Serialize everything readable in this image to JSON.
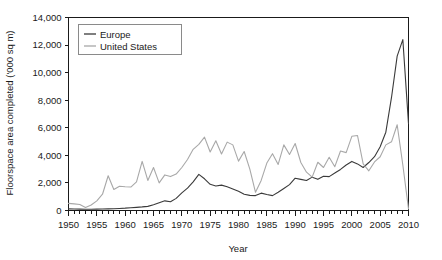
{
  "chart_data": {
    "type": "line",
    "title": "",
    "xlabel": "Year",
    "ylabel": "Floorspace area completed ('000 sq m)",
    "xlim": [
      1950,
      2010
    ],
    "ylim": [
      0,
      14000
    ],
    "ytick_step": 2000,
    "xtick_major_step": 5,
    "xtick_minor_step": 1,
    "grid": false,
    "legend_position": "top-left",
    "ytick_labels": [
      "0",
      "2,000",
      "4,000",
      "6,000",
      "8,000",
      "10,000",
      "12,000",
      "14,000"
    ],
    "ytick_values": [
      0,
      2000,
      4000,
      6000,
      8000,
      10000,
      12000,
      14000
    ],
    "xtick_labels": [
      "1950",
      "1955",
      "1960",
      "1965",
      "1970",
      "1975",
      "1980",
      "1985",
      "1990",
      "1995",
      "2000",
      "2005",
      "2010"
    ],
    "xtick_values": [
      1950,
      1955,
      1960,
      1965,
      1970,
      1975,
      1980,
      1985,
      1990,
      1995,
      2000,
      2005,
      2010
    ],
    "x": [
      1950,
      1951,
      1952,
      1953,
      1954,
      1955,
      1956,
      1957,
      1958,
      1959,
      1960,
      1961,
      1962,
      1963,
      1964,
      1965,
      1966,
      1967,
      1968,
      1969,
      1970,
      1971,
      1972,
      1973,
      1974,
      1975,
      1976,
      1977,
      1978,
      1979,
      1980,
      1981,
      1982,
      1983,
      1984,
      1985,
      1986,
      1987,
      1988,
      1989,
      1990,
      1991,
      1992,
      1993,
      1994,
      1995,
      1996,
      1997,
      1998,
      1999,
      2000,
      2001,
      2002,
      2003,
      2004,
      2005,
      2006,
      2007,
      2008,
      2009,
      2010
    ],
    "series": [
      {
        "name": "Europe",
        "color": "#3a3a3a",
        "values": [
          120,
          110,
          100,
          95,
          90,
          100,
          110,
          120,
          130,
          150,
          170,
          200,
          230,
          260,
          300,
          420,
          560,
          700,
          640,
          880,
          1280,
          1620,
          2080,
          2620,
          2300,
          1900,
          1780,
          1840,
          1720,
          1560,
          1400,
          1180,
          1100,
          1080,
          1260,
          1160,
          1080,
          1320,
          1600,
          1880,
          2340,
          2260,
          2180,
          2420,
          2260,
          2480,
          2460,
          2720,
          2980,
          3300,
          3560,
          3380,
          3120,
          3480,
          3900,
          4620,
          5680,
          8200,
          11200,
          12400,
          6300
        ]
      },
      {
        "name": "United States",
        "color": "#a8a8a8",
        "values": [
          520,
          480,
          440,
          220,
          400,
          700,
          1180,
          2520,
          1520,
          1760,
          1720,
          1700,
          2080,
          3560,
          2180,
          3120,
          2000,
          2580,
          2460,
          2640,
          3120,
          3700,
          4440,
          4800,
          5320,
          4240,
          5060,
          4100,
          4960,
          4760,
          3580,
          4280,
          3000,
          1320,
          2180,
          3440,
          4120,
          3340,
          4760,
          4060,
          4860,
          3480,
          2780,
          2420,
          3500,
          3120,
          3860,
          3180,
          4320,
          4200,
          5380,
          5440,
          3380,
          2880,
          3520,
          3900,
          4760,
          4980,
          6220,
          3300,
          120
        ]
      }
    ]
  },
  "axes": {
    "ylabel": "Floorspace area completed ('000 sq m)",
    "xlabel": "Year"
  },
  "legend": {
    "entries": [
      {
        "label": "Europe",
        "color": "#3a3a3a"
      },
      {
        "label": "United States",
        "color": "#a8a8a8"
      }
    ]
  }
}
